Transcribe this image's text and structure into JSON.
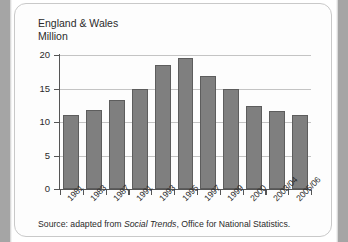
{
  "chart_data": {
    "type": "bar",
    "title": "England & Wales",
    "subtitle": "Million",
    "xlabel": "",
    "ylabel": "Million",
    "ylim": [
      0,
      20
    ],
    "yticks": [
      0,
      5,
      10,
      15,
      20
    ],
    "grid": true,
    "legend": "none",
    "categories": [
      "1981",
      "1983",
      "1987",
      "1991",
      "1993",
      "1995",
      "1997",
      "1999",
      "2000",
      "2003/04",
      "2005/06"
    ],
    "values": [
      11.0,
      11.8,
      13.3,
      15.0,
      18.5,
      19.5,
      16.8,
      15.0,
      12.4,
      11.7,
      11.0
    ],
    "bar_color": "#7f7f7f",
    "bar_edge_color": "#5d5d5d",
    "gridline_color": "#c4c4c4",
    "axis_color": "#555555"
  },
  "source": {
    "prefix": "Source: adapted from ",
    "publication": "Social Trends",
    "suffix": ", Office for National Statistics."
  }
}
